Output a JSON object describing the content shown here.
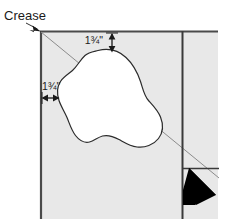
{
  "figure": {
    "background_color": "#ffffff"
  },
  "annotations": {
    "crease": {
      "label": "Crease",
      "icon": "leader-arrow-icon",
      "points_to": "panel-top-left-corner"
    },
    "dimension_top": {
      "label": "1¾\"",
      "value": "1.75",
      "unit": "inch",
      "orientation": "vertical",
      "icon": "double-arrow-vertical-icon"
    },
    "dimension_left": {
      "label": "1¾\"",
      "value": "1.75",
      "unit": "inch",
      "orientation": "horizontal",
      "icon": "double-arrow-horizontal-icon"
    }
  },
  "shapes": {
    "panel": {
      "name": "fabric-panel",
      "fill": "#e8e8e8",
      "border_color": "#4a4a4a"
    },
    "crease_line": {
      "name": "diagonal-crease-line",
      "stroke": "#8c8c8c"
    },
    "blob": {
      "name": "applique-shape",
      "fill": "#ffffff",
      "stroke": "#2b2b2b"
    },
    "seam_lines": {
      "name": "seam-guide-lines",
      "stroke": "#3a3a3a"
    },
    "corner_arrow": {
      "name": "direction-arrow",
      "fill": "#000000"
    }
  },
  "colors": {
    "panel_gray": "#e8e8e8",
    "panel_border": "#4a4a4a",
    "crease_gray": "#8c8c8c",
    "ink": "#1a1a1a",
    "black": "#000000",
    "white": "#ffffff"
  }
}
